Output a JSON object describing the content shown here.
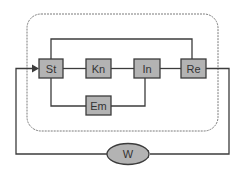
{
  "diagram": {
    "nodes": [
      {
        "id": "st",
        "label": "St"
      },
      {
        "id": "kn",
        "label": "Kn"
      },
      {
        "id": "in",
        "label": "In"
      },
      {
        "id": "re",
        "label": "Re"
      },
      {
        "id": "em",
        "label": "Em"
      },
      {
        "id": "w",
        "label": "W"
      }
    ],
    "edges": [
      {
        "from": "st",
        "to": "kn"
      },
      {
        "from": "kn",
        "to": "in"
      },
      {
        "from": "in",
        "to": "re"
      },
      {
        "from": "st",
        "to": "re",
        "route": "top"
      },
      {
        "from": "st",
        "to": "em",
        "route": "bottom"
      },
      {
        "from": "em",
        "to": "in"
      },
      {
        "from": "re",
        "to": "w",
        "arrow": true
      },
      {
        "from": "w",
        "to": "st",
        "arrow": true
      }
    ],
    "group": {
      "style": "dashed-rounded",
      "contains": [
        "st",
        "kn",
        "in",
        "re",
        "em"
      ]
    },
    "colors": {
      "node_fill": "#b3b3b3",
      "node_stroke": "#3c3c3c",
      "line": "#3c3c3c",
      "group_stroke": "#7a7a7a"
    }
  }
}
